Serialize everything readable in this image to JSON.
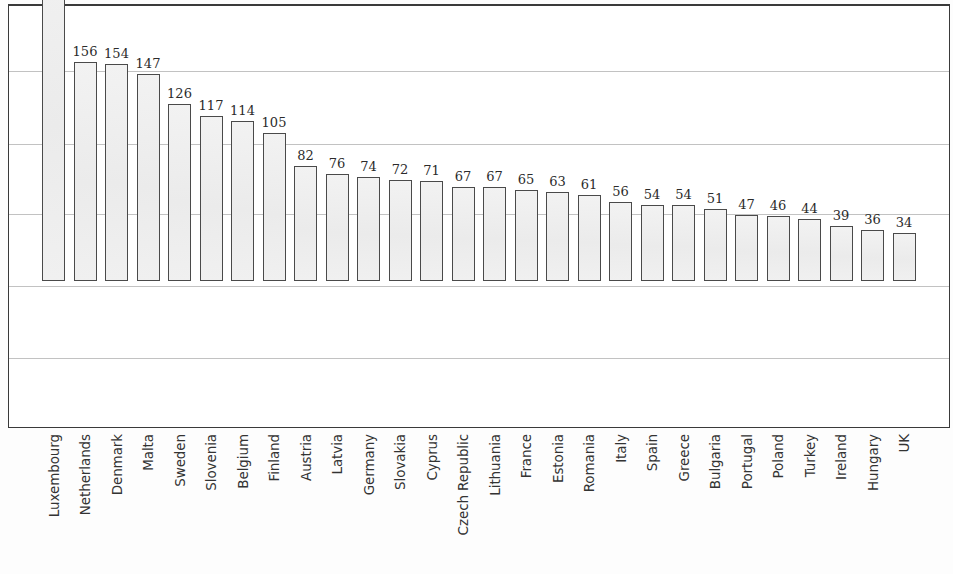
{
  "chart_data": {
    "type": "bar",
    "title": "",
    "subtitle": "",
    "xlabel": "",
    "ylabel": "",
    "ylim": [
      0,
      300
    ],
    "grid": true,
    "gridline_values": [
      50,
      100,
      150,
      200,
      250,
      300
    ],
    "legend": "none",
    "orientation": "vertical",
    "value_labels_shown": true,
    "categories": [
      "Luxembourg",
      "Netherlands",
      "Denmark",
      "Malta",
      "Sweden",
      "Slovenia",
      "Belgium",
      "Finland",
      "Austria",
      "Latvia",
      "Germany",
      "Slovakia",
      "Cyprus",
      "Czech Republic",
      "Lithuania",
      "France",
      "Estonia",
      "Romania",
      "Italy",
      "Spain",
      "Greece",
      "Bulgaria",
      "Portugal",
      "Poland",
      "Turkey",
      "Ireland",
      "Hungary",
      "UK"
    ],
    "values": [
      246,
      156,
      154,
      147,
      126,
      117,
      114,
      105,
      82,
      76,
      74,
      72,
      71,
      67,
      67,
      65,
      63,
      61,
      56,
      54,
      54,
      51,
      47,
      46,
      44,
      39,
      36,
      34
    ],
    "value_label_text": [
      "",
      "156",
      "154",
      "147",
      "126",
      "117",
      "114",
      "105",
      "82",
      "76",
      "74",
      "72",
      "71",
      "67",
      "67",
      "65",
      "63",
      "61",
      "56",
      "54",
      "54",
      "51",
      "47",
      "46",
      "44",
      "39",
      "36",
      "34"
    ]
  },
  "style": {
    "bar_fill": "#efefef",
    "bar_border": "#4a4a4a",
    "gridline_color": "#c2c2c2",
    "frame_color": "#3a3a3a",
    "label_color": "#333333",
    "value_color": "#2b2b2b",
    "background": "#ffffff"
  }
}
